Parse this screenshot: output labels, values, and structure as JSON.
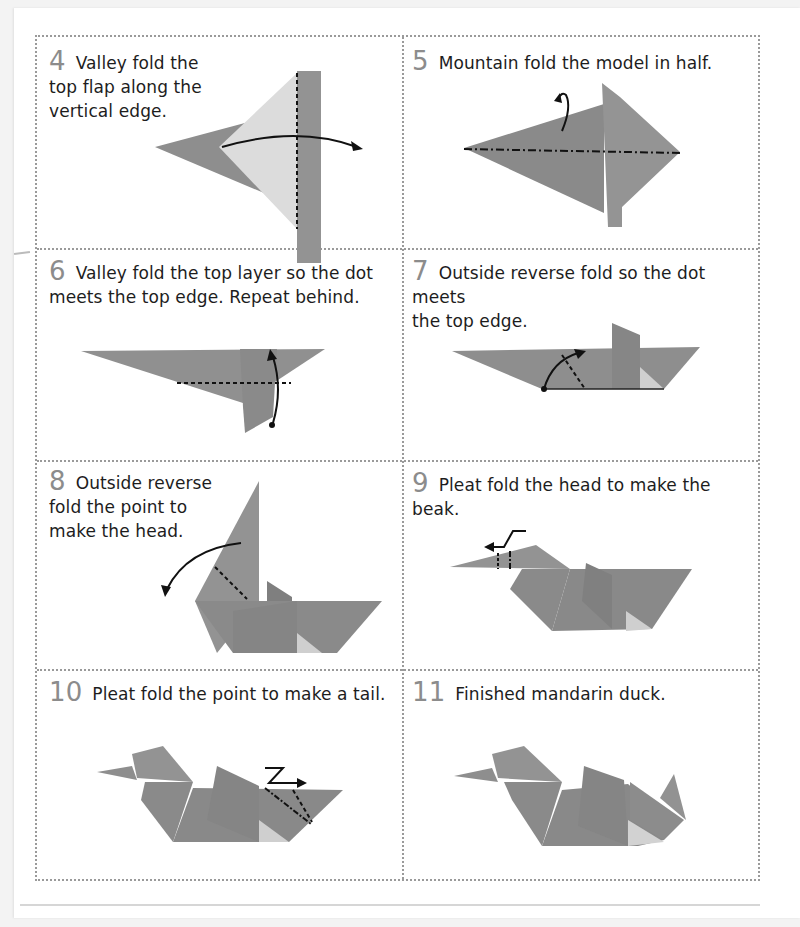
{
  "document": {
    "type": "origami instructions",
    "subject": "mandarin duck",
    "paper_color": "#8e8e8e",
    "paper_light_color": "#d9d9d9",
    "border_color": "#9a9a9a"
  },
  "steps": [
    {
      "number": "4",
      "text_lines": [
        "Valley fold the",
        "top flap along the",
        "vertical edge."
      ],
      "diagram": "valley-fold-flap-diagram"
    },
    {
      "number": "5",
      "text_lines": [
        "Mountain fold the model in half."
      ],
      "diagram": "mountain-fold-half-diagram"
    },
    {
      "number": "6",
      "text_lines": [
        "Valley fold the top layer so the dot",
        "meets the top edge. Repeat behind."
      ],
      "diagram": "valley-fold-top-layer-diagram"
    },
    {
      "number": "7",
      "text_lines": [
        "Outside reverse fold so the dot meets",
        "the top edge."
      ],
      "diagram": "outside-reverse-fold-diagram"
    },
    {
      "number": "8",
      "text_lines": [
        "Outside reverse",
        "fold the point to",
        "make the head."
      ],
      "diagram": "head-fold-diagram"
    },
    {
      "number": "9",
      "text_lines": [
        "Pleat fold the head to make the beak."
      ],
      "diagram": "beak-pleat-diagram"
    },
    {
      "number": "10",
      "text_lines": [
        "Pleat fold the point to make a tail."
      ],
      "diagram": "tail-pleat-diagram"
    },
    {
      "number": "11",
      "text_lines": [
        "Finished mandarin duck."
      ],
      "diagram": "finished-duck-diagram"
    }
  ]
}
